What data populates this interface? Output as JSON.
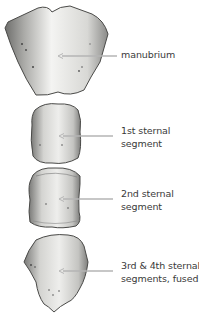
{
  "diagram": {
    "colors": {
      "bone_light": "#f2f2f0",
      "bone_mid": "#c9c9c6",
      "bone_dark": "#6e6e6c",
      "outline": "#4a4a48",
      "leader_line": "#b5b5b5",
      "label_text": "#3a3a3a"
    },
    "labels": [
      {
        "id": "manubrium",
        "lines": [
          "manubrium"
        ]
      },
      {
        "id": "segment-1",
        "lines": [
          "1st sternal",
          "segment"
        ]
      },
      {
        "id": "segment-2",
        "lines": [
          "2nd sternal",
          "segment"
        ]
      },
      {
        "id": "segment-3-4",
        "lines": [
          "3rd & 4th sternal",
          "segments, fused"
        ]
      }
    ]
  }
}
